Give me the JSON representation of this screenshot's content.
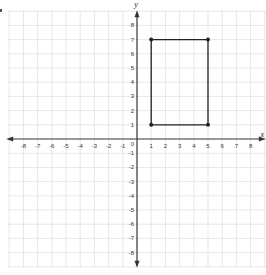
{
  "chart_data": {
    "type": "scatter",
    "title": "",
    "xlabel": "x",
    "ylabel": "y",
    "xlim": [
      -9,
      9
    ],
    "ylim": [
      -9,
      9
    ],
    "grid": true,
    "x_ticks": [
      -8,
      -7,
      -6,
      -5,
      -4,
      -3,
      -2,
      -1,
      1,
      2,
      3,
      4,
      5,
      6,
      7,
      8
    ],
    "y_ticks": [
      8,
      7,
      6,
      5,
      4,
      3,
      2,
      1,
      -1,
      -2,
      -3,
      -4,
      -5,
      -6,
      -7,
      -8
    ],
    "origin_label": "0",
    "shape": "rectangle",
    "points": [
      {
        "x": 1,
        "y": 7
      },
      {
        "x": 5,
        "y": 7
      },
      {
        "x": 5,
        "y": 1
      },
      {
        "x": 1,
        "y": 1
      }
    ]
  },
  "colors": {
    "grid": "#d6d6d6",
    "axis": "#333333",
    "shape": "#222222"
  }
}
